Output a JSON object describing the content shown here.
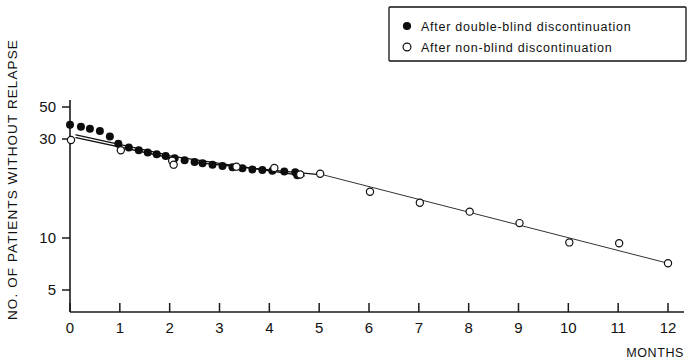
{
  "chart_data": {
    "type": "scatter",
    "title": "",
    "xlabel": "MONTHS",
    "ylabel": "NO. OF PATIENTS WITHOUT RELAPSE",
    "yscale": "log",
    "xlim": [
      0,
      12
    ],
    "ylim": [
      4.2,
      58
    ],
    "grid": false,
    "xticks": [
      0,
      1,
      2,
      3,
      4,
      5,
      6,
      7,
      8,
      9,
      10,
      11,
      12
    ],
    "xticklabels": [
      "0",
      "1",
      "2",
      "3",
      "4",
      "5",
      "6",
      "7",
      "8",
      "9",
      "10",
      "11",
      "12"
    ],
    "yticks": [
      5,
      10,
      30,
      50
    ],
    "yticklabels": [
      "5",
      "10",
      "30",
      "50"
    ],
    "legend_position": "top-right",
    "series": [
      {
        "name": "After double-blind discontinuation",
        "marker": "filled-circle",
        "points": [
          {
            "x": 0.0,
            "y": 40.0
          },
          {
            "x": 0.22,
            "y": 39.0
          },
          {
            "x": 0.4,
            "y": 38.0
          },
          {
            "x": 0.6,
            "y": 37.0
          },
          {
            "x": 0.8,
            "y": 34.5
          },
          {
            "x": 0.97,
            "y": 31.5
          },
          {
            "x": 1.18,
            "y": 30.0
          },
          {
            "x": 1.38,
            "y": 29.0
          },
          {
            "x": 1.56,
            "y": 28.2
          },
          {
            "x": 1.74,
            "y": 27.6
          },
          {
            "x": 1.92,
            "y": 27.0
          },
          {
            "x": 2.1,
            "y": 26.2
          },
          {
            "x": 2.3,
            "y": 25.6
          },
          {
            "x": 2.5,
            "y": 25.0
          },
          {
            "x": 2.66,
            "y": 24.6
          },
          {
            "x": 2.86,
            "y": 24.2
          },
          {
            "x": 3.06,
            "y": 23.8
          },
          {
            "x": 3.26,
            "y": 23.4
          },
          {
            "x": 3.46,
            "y": 23.1
          },
          {
            "x": 3.66,
            "y": 22.8
          },
          {
            "x": 3.86,
            "y": 22.6
          },
          {
            "x": 4.06,
            "y": 22.4
          },
          {
            "x": 4.3,
            "y": 22.2
          },
          {
            "x": 4.52,
            "y": 22.0
          },
          {
            "x": 4.56,
            "y": 21.2
          }
        ]
      },
      {
        "name": "After non-blind discontinuation",
        "marker": "open-circle",
        "points": [
          {
            "x": 0.02,
            "y": 33.0
          },
          {
            "x": 1.02,
            "y": 29.0
          },
          {
            "x": 2.05,
            "y": 25.4
          },
          {
            "x": 2.08,
            "y": 24.2
          },
          {
            "x": 3.34,
            "y": 23.6
          },
          {
            "x": 4.1,
            "y": 23.2
          },
          {
            "x": 4.62,
            "y": 21.4
          },
          {
            "x": 5.02,
            "y": 21.6
          },
          {
            "x": 6.02,
            "y": 17.2
          },
          {
            "x": 7.02,
            "y": 15.0
          },
          {
            "x": 8.02,
            "y": 13.4
          },
          {
            "x": 9.02,
            "y": 11.6
          },
          {
            "x": 10.02,
            "y": 9.1
          },
          {
            "x": 11.02,
            "y": 9.0
          },
          {
            "x": 12.0,
            "y": 7.0
          }
        ]
      }
    ],
    "fit_lines": [
      {
        "name": "double-blind-early-fit",
        "x0": 0.12,
        "y0": 35.2,
        "x1": 1.88,
        "y1": 27.6
      },
      {
        "name": "non-blind-early-fit",
        "x0": 0.12,
        "y0": 34.0,
        "x1": 2.0,
        "y1": 26.4
      },
      {
        "name": "double-blind-late-fit",
        "x0": 2.0,
        "y0": 27.0,
        "x1": 4.7,
        "y1": 21.0
      },
      {
        "name": "non-blind-mid-fit",
        "x0": 2.55,
        "y0": 24.8,
        "x1": 4.95,
        "y1": 21.4
      },
      {
        "name": "non-blind-long-fit",
        "x0": 5.05,
        "y0": 21.4,
        "x1": 12.0,
        "y1": 7.0
      }
    ]
  },
  "legend": {
    "items": [
      {
        "marker": "filled-circle",
        "label": "After double-blind discontinuation"
      },
      {
        "marker": "open-circle",
        "label": "After non-blind discontinuation"
      }
    ]
  },
  "axis": {
    "y_title": "NO. OF PATIENTS WITHOUT RELAPSE",
    "x_title": "MONTHS"
  },
  "colors": {
    "ink": "#111111",
    "marker_filled": "#0d0d0d",
    "marker_open_fill": "#ffffff",
    "background": "#ffffff"
  }
}
